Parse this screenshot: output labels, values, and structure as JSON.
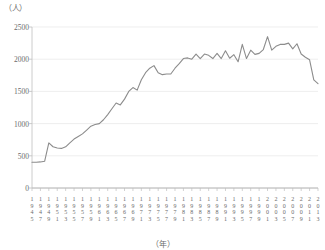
{
  "chart_data": {
    "type": "line",
    "title": "",
    "subtitle": "",
    "xlabel": "（年）",
    "ylabel": "（人）",
    "ylim": [
      0,
      2500
    ],
    "xlim": [
      1945,
      2013
    ],
    "ytick_values": [
      0,
      500,
      1000,
      1500,
      2000,
      2500
    ],
    "ytick_labels": [
      "0",
      "500",
      "1000",
      "1500",
      "2000",
      "2500"
    ],
    "xtick_labels": [
      "1945",
      "1947",
      "1949",
      "1951",
      "1953",
      "1955",
      "1957",
      "1959",
      "1961",
      "1963",
      "1965",
      "1967",
      "1969",
      "1971",
      "1973",
      "1975",
      "1977",
      "1979",
      "1981",
      "1983",
      "1985",
      "1987",
      "1989",
      "1991",
      "1993",
      "1995",
      "1997",
      "1999",
      "2001",
      "2003",
      "2005",
      "2007",
      "2009",
      "2011",
      "2013"
    ],
    "grid": true,
    "grid_axis": "y",
    "legend": false,
    "legend_position": "none",
    "line_color": "#8c8c8c",
    "grid_color": "#e6e6e6",
    "axis_color": "#bfbfbf",
    "text_color": "#6b6b6b",
    "x": [
      1945,
      1946,
      1947,
      1948,
      1949,
      1950,
      1951,
      1952,
      1953,
      1954,
      1955,
      1956,
      1957,
      1958,
      1959,
      1960,
      1961,
      1962,
      1963,
      1964,
      1965,
      1966,
      1967,
      1968,
      1969,
      1970,
      1971,
      1972,
      1973,
      1974,
      1975,
      1976,
      1977,
      1978,
      1979,
      1980,
      1981,
      1982,
      1983,
      1984,
      1985,
      1986,
      1987,
      1988,
      1989,
      1990,
      1991,
      1992,
      1993,
      1994,
      1995,
      1996,
      1997,
      1998,
      1999,
      2000,
      2001,
      2002,
      2003,
      2004,
      2005,
      2006,
      2007,
      2008,
      2009,
      2010,
      2011,
      2012,
      2013
    ],
    "values": [
      400,
      400,
      405,
      415,
      700,
      640,
      620,
      615,
      640,
      700,
      760,
      800,
      840,
      900,
      960,
      985,
      1000,
      1060,
      1140,
      1230,
      1320,
      1290,
      1380,
      1500,
      1560,
      1520,
      1680,
      1790,
      1860,
      1900,
      1790,
      1760,
      1770,
      1770,
      1860,
      1930,
      2010,
      2020,
      2000,
      2080,
      2010,
      2080,
      2060,
      2010,
      2090,
      2010,
      2130,
      2015,
      2070,
      1960,
      2230,
      2010,
      2140,
      2075,
      2090,
      2150,
      2350,
      2140,
      2200,
      2230,
      2230,
      2250,
      2160,
      2240,
      2080,
      2030,
      1990,
      1680,
      1620
    ],
    "series": [
      {
        "name": "人数",
        "values": [
          400,
          400,
          405,
          415,
          700,
          640,
          620,
          615,
          640,
          700,
          760,
          800,
          840,
          900,
          960,
          985,
          1000,
          1060,
          1140,
          1230,
          1320,
          1290,
          1380,
          1500,
          1560,
          1520,
          1680,
          1790,
          1860,
          1900,
          1790,
          1760,
          1770,
          1770,
          1860,
          1930,
          2010,
          2020,
          2000,
          2080,
          2010,
          2080,
          2060,
          2010,
          2090,
          2010,
          2130,
          2015,
          2070,
          1960,
          2230,
          2010,
          2140,
          2075,
          2090,
          2150,
          2350,
          2140,
          2200,
          2230,
          2230,
          2250,
          2160,
          2240,
          2080,
          2030,
          1990,
          1680,
          1620
        ]
      }
    ],
    "annotations": []
  }
}
